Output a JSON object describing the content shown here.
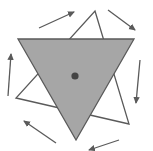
{
  "diagram": {
    "title": "",
    "rotation_direction": "clockwise",
    "arrow_count": 6,
    "colors": {
      "shaded_fill": "#a6a6a6",
      "stroke": "#5a5a5a",
      "center_dot": "#444444",
      "outline_fill": "#ffffff"
    }
  }
}
